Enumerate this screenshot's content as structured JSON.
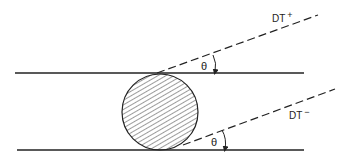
{
  "diagram": {
    "type": "geometry-schematic",
    "colors": {
      "stroke": "#222222",
      "background": "#ffffff"
    },
    "labels": {
      "dt_plus": "DT",
      "dt_plus_sup": "+",
      "dt_minus": "DT",
      "dt_minus_sup": "−",
      "theta_top": "θ",
      "theta_bottom": "θ"
    },
    "elements": [
      {
        "id": "top-line",
        "kind": "solid-line"
      },
      {
        "id": "bottom-line",
        "kind": "solid-line"
      },
      {
        "id": "circle",
        "kind": "hatched-circle"
      },
      {
        "id": "dt-plus-line",
        "kind": "dashed-line",
        "label": "DT+"
      },
      {
        "id": "dt-minus-line",
        "kind": "dashed-line",
        "label": "DT-"
      },
      {
        "id": "theta-arc-top",
        "kind": "angle-arrow",
        "label": "θ"
      },
      {
        "id": "theta-arc-bottom",
        "kind": "angle-arrow",
        "label": "θ"
      }
    ]
  }
}
